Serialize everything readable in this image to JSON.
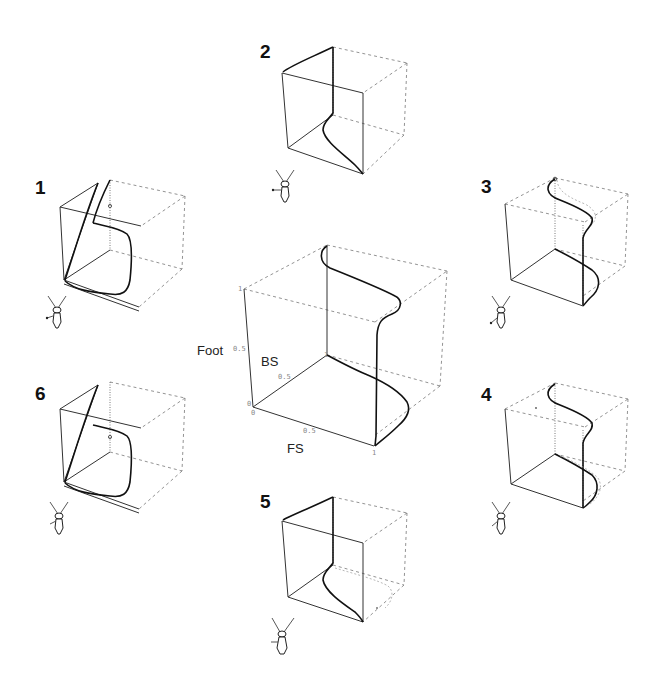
{
  "figure": {
    "center": {
      "axis_labels": {
        "vertical": "Foot",
        "depth": "BS",
        "horizontal": "FS"
      },
      "ticks": {
        "vertical": [
          "0",
          "0.5",
          "1"
        ],
        "depth": [
          "0.5",
          "1"
        ],
        "horizontal": [
          "0",
          "0.5",
          "1"
        ]
      }
    },
    "panels": [
      {
        "id": "1",
        "label": "1",
        "position": "left-upper"
      },
      {
        "id": "2",
        "label": "2",
        "position": "top-center"
      },
      {
        "id": "3",
        "label": "3",
        "position": "right-upper"
      },
      {
        "id": "4",
        "label": "4",
        "position": "right-lower"
      },
      {
        "id": "5",
        "label": "5",
        "position": "bottom-center"
      },
      {
        "id": "6",
        "label": "6",
        "position": "left-lower"
      }
    ],
    "colors": {
      "line": "#111111",
      "dashed": "#777777",
      "background": "#ffffff"
    }
  }
}
